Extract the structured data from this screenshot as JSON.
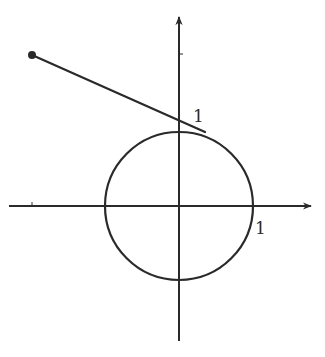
{
  "diagram": {
    "type": "unit-circle-with-tangent-line",
    "colors": {
      "stroke": "#2a2a2a",
      "background": "#ffffff"
    },
    "axes": {
      "x_axis": {
        "x1": 9,
        "y": 206,
        "x2": 311,
        "arrow": "right",
        "tick_x": 32
      },
      "y_axis": {
        "x": 179,
        "y1": 341,
        "y2": 17,
        "arrow": "up",
        "tick_y": 54
      }
    },
    "circle": {
      "cx": 179,
      "cy": 206,
      "r": 74
    },
    "segment": {
      "start": {
        "x": 32,
        "y": 55
      },
      "end": {
        "x": 205,
        "y": 132
      },
      "start_dot_radius": 4
    },
    "labels": {
      "y_unit": "1",
      "x_unit": "1"
    }
  }
}
